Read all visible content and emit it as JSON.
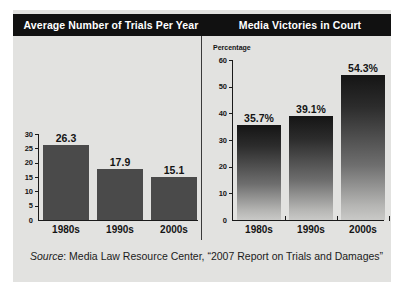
{
  "panels": {
    "left": {
      "title": "Average Number of Trials Per Year"
    },
    "right": {
      "title": "Media Victories in Court"
    }
  },
  "source": {
    "label": "Source",
    "text": ": Media Law Resource Center, “2007 Report on Trials and Damages”"
  },
  "colors": {
    "header_band": "#111111",
    "card_background": "#e2e2e0",
    "bar_left": "#4a4a4a",
    "bar_right_top": "#151515",
    "bar_right_bottom": "#c9c9c7",
    "axis": "#1a1a1a",
    "text": "#141414"
  },
  "chart_data": [
    {
      "type": "bar",
      "title": "Average Number of Trials Per Year",
      "xlabel": "",
      "ylabel": "",
      "categories": [
        "1980s",
        "1990s",
        "2000s"
      ],
      "values": [
        26.3,
        17.9,
        15.1
      ],
      "data_labels": [
        "26.3",
        "17.9",
        "15.1"
      ],
      "yticks": [
        0,
        5,
        10,
        15,
        20,
        25,
        30
      ],
      "ytick_labels": [
        "0",
        "5",
        "10",
        "15",
        "20",
        "25",
        "30"
      ],
      "ylim": [
        0,
        30
      ],
      "grid": false,
      "legend": false
    },
    {
      "type": "bar",
      "title": "Media Victories in Court",
      "xlabel": "",
      "ylabel": "Percentage",
      "categories": [
        "1980s",
        "1990s",
        "2000s"
      ],
      "values": [
        35.7,
        39.1,
        54.3
      ],
      "data_labels": [
        "35.7%",
        "39.1%",
        "54.3%"
      ],
      "yticks": [
        0,
        10,
        20,
        30,
        40,
        50,
        60
      ],
      "ytick_labels": [
        "0",
        "10",
        "20",
        "30",
        "40",
        "50",
        "60"
      ],
      "ylim": [
        0,
        60
      ],
      "grid": false,
      "legend": false
    }
  ]
}
